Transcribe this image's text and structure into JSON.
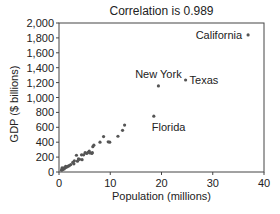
{
  "chart_data": {
    "type": "scatter",
    "title": "Correlation is 0.989",
    "xlabel": "Population (millions)",
    "ylabel": "GDP ($ billions)",
    "xlim": [
      0,
      40
    ],
    "ylim": [
      0,
      2000
    ],
    "xticks": [
      0,
      10,
      20,
      30,
      40
    ],
    "yticks": [
      0,
      200,
      400,
      600,
      800,
      1000,
      1200,
      1400,
      1600,
      1800,
      2000
    ],
    "ytick_labels": [
      "0",
      "200",
      "400",
      "600",
      "800",
      "1,000",
      "1,200",
      "1,400",
      "1,600",
      "1,800",
      "2,000"
    ],
    "grid": false,
    "marker_color": "#555555",
    "points": [
      {
        "x": 36.9,
        "y": 1840,
        "label": "California",
        "label_pos": "left"
      },
      {
        "x": 24.7,
        "y": 1235,
        "label": "Texas",
        "label_pos": "right"
      },
      {
        "x": 19.4,
        "y": 1155,
        "label": "New York",
        "label_pos": "above"
      },
      {
        "x": 18.5,
        "y": 750,
        "label": "Florida",
        "label_pos": "below"
      },
      {
        "x": 12.8,
        "y": 630
      },
      {
        "x": 12.4,
        "y": 560
      },
      {
        "x": 11.5,
        "y": 480
      },
      {
        "x": 9.9,
        "y": 400
      },
      {
        "x": 9.6,
        "y": 405
      },
      {
        "x": 8.7,
        "y": 475
      },
      {
        "x": 8.0,
        "y": 400
      },
      {
        "x": 6.8,
        "y": 360
      },
      {
        "x": 6.6,
        "y": 340
      },
      {
        "x": 6.5,
        "y": 260
      },
      {
        "x": 6.4,
        "y": 250
      },
      {
        "x": 6.0,
        "y": 255
      },
      {
        "x": 5.9,
        "y": 280
      },
      {
        "x": 5.7,
        "y": 265
      },
      {
        "x": 5.4,
        "y": 250
      },
      {
        "x": 5.1,
        "y": 260
      },
      {
        "x": 4.8,
        "y": 230
      },
      {
        "x": 4.5,
        "y": 165
      },
      {
        "x": 4.4,
        "y": 230
      },
      {
        "x": 4.0,
        "y": 170
      },
      {
        "x": 3.8,
        "y": 175
      },
      {
        "x": 3.6,
        "y": 145
      },
      {
        "x": 3.4,
        "y": 225
      },
      {
        "x": 3.0,
        "y": 150
      },
      {
        "x": 2.9,
        "y": 110
      },
      {
        "x": 2.7,
        "y": 130
      },
      {
        "x": 2.3,
        "y": 100
      },
      {
        "x": 2.0,
        "y": 85
      },
      {
        "x": 1.8,
        "y": 80
      },
      {
        "x": 1.6,
        "y": 70
      },
      {
        "x": 1.3,
        "y": 60
      },
      {
        "x": 1.3,
        "y": 75
      },
      {
        "x": 1.0,
        "y": 55
      },
      {
        "x": 1.0,
        "y": 40
      },
      {
        "x": 0.9,
        "y": 45
      },
      {
        "x": 0.8,
        "y": 50
      },
      {
        "x": 0.7,
        "y": 35
      },
      {
        "x": 0.6,
        "y": 40
      },
      {
        "x": 0.6,
        "y": 30
      },
      {
        "x": 0.5,
        "y": 25
      },
      {
        "x": 0.6,
        "y": 55
      }
    ]
  }
}
